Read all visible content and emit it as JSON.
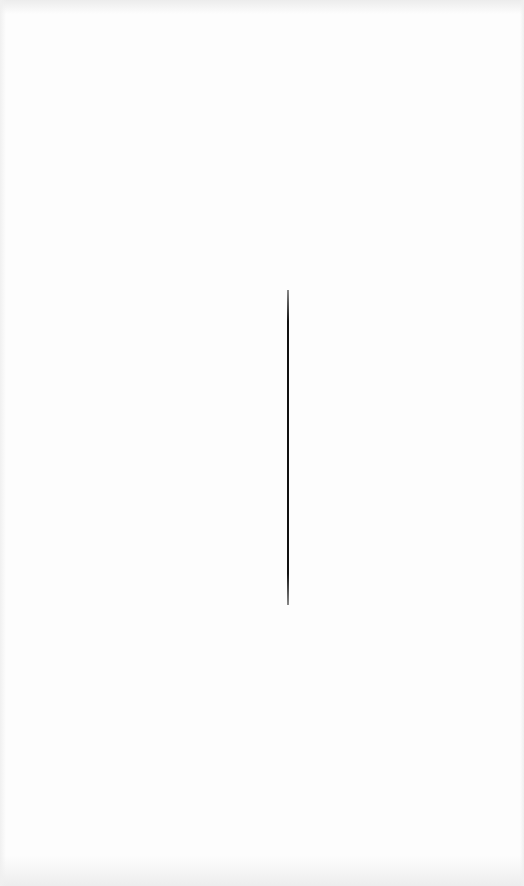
{
  "canvas": {
    "width": 524,
    "height": 886,
    "background": "#fdfdfd"
  },
  "elements": {
    "vertical_line": {
      "x": 288,
      "y_start": 290,
      "y_end": 605,
      "color": "#111111"
    }
  },
  "faint_text_regions": [
    {
      "y": 215,
      "text": ""
    },
    {
      "y": 355,
      "text": ""
    },
    {
      "y": 522,
      "text": ""
    }
  ],
  "note": "Screenshot content is washed out; no legible text recoverable."
}
